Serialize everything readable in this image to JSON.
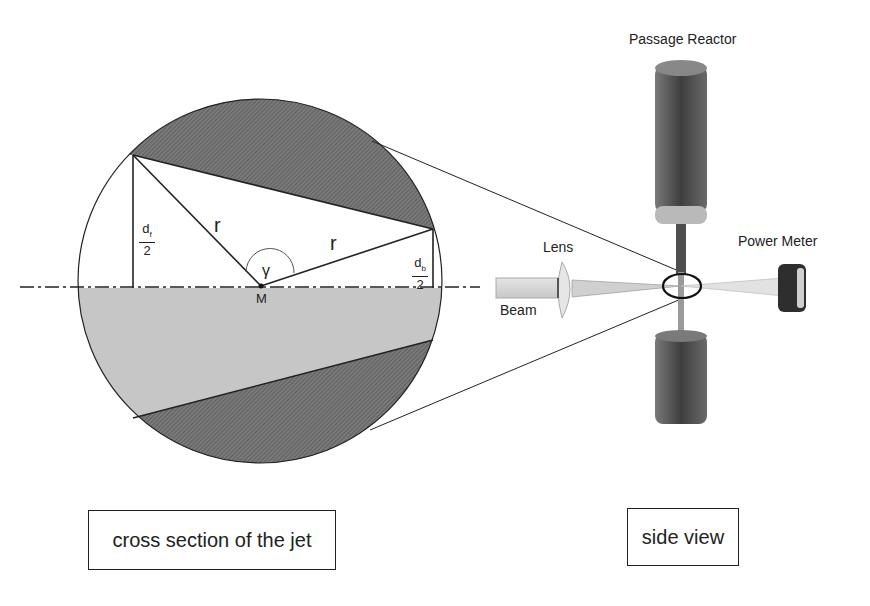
{
  "cross_section": {
    "label_r_left": "r",
    "label_r_right": "r",
    "label_gamma": "γ",
    "label_center": "M",
    "df_numerator": "d",
    "df_subscript": "f",
    "df_denominator": "2",
    "db_numerator": "d",
    "db_subscript": "b",
    "db_denominator": "2",
    "caption": "cross section of the jet"
  },
  "side_view": {
    "reactor_label": "Passage Reactor",
    "lens_label": "Lens",
    "beam_label": "Beam",
    "power_meter_label": "Power Meter",
    "caption": "side view"
  },
  "colors": {
    "hatched_segment": "#6e6e6e",
    "lower_fill": "#c4c4c4",
    "outline": "#222222",
    "reactor": "#4a4a4a",
    "beam": "#d8d8d8"
  }
}
